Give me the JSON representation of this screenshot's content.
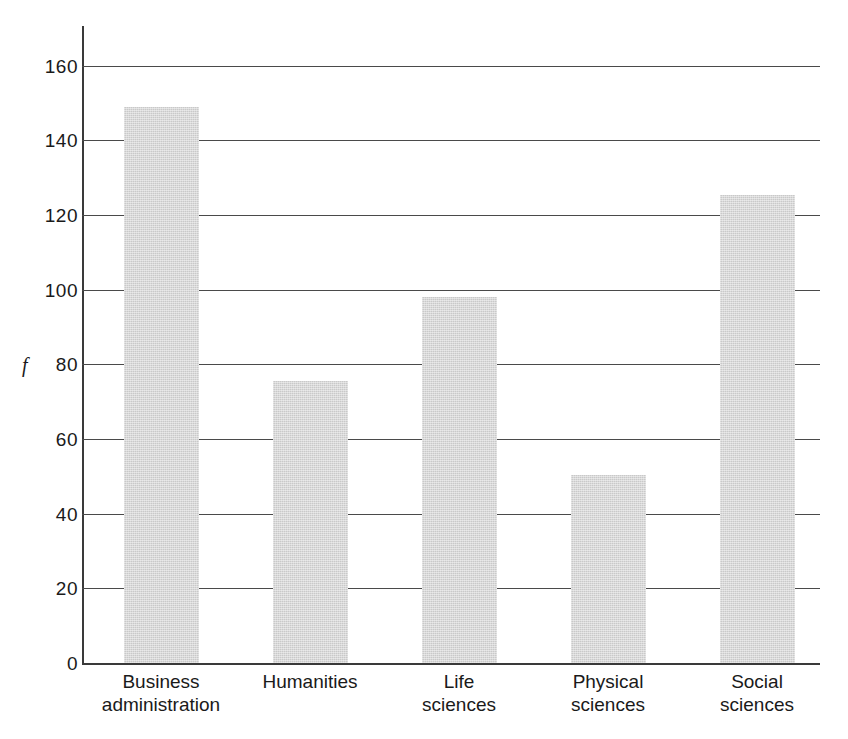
{
  "chart_data": {
    "type": "bar",
    "title": "",
    "xlabel": "",
    "ylabel": "f",
    "ylim": [
      0,
      160
    ],
    "ytick_step": 20,
    "grid": true,
    "legend": "none",
    "categories": [
      "Business administration",
      "Humanities",
      "Life sciences",
      "Physical sciences",
      "Social sciences"
    ],
    "category_lines": [
      [
        "Business",
        "administration"
      ],
      [
        "Humanities"
      ],
      [
        "Life",
        "sciences"
      ],
      [
        "Physical",
        "sciences"
      ],
      [
        "Social",
        "sciences"
      ]
    ],
    "values": [
      149,
      75.5,
      98,
      50.5,
      125.5
    ],
    "ytick_labels": [
      "160",
      "140",
      "120",
      "100",
      "80",
      "60",
      "40",
      "20",
      "0"
    ],
    "ytick_values": [
      160,
      140,
      120,
      100,
      80,
      60,
      40,
      20,
      0
    ],
    "bar_color": "#c9c9c9",
    "axis_color": "#3a3a3a",
    "gridline_color": "#4a4a4a",
    "background_color": "#ffffff"
  }
}
